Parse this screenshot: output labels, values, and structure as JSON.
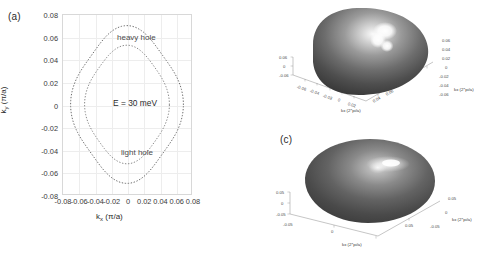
{
  "figure": {
    "panels": [
      {
        "tag": "(a)"
      },
      {
        "tag": "(b)"
      },
      {
        "tag": "(c)"
      }
    ]
  },
  "panel_a": {
    "tag": "(a)",
    "xlabel_main": "k",
    "xlabel_sub": "x",
    "xlabel_unit": "(π/a)",
    "ylabel_main": "k",
    "ylabel_sub": "y",
    "ylabel_unit": "(π/a)",
    "annotation_energy": "E = 30 meV",
    "label_heavy": "heavy hole",
    "label_light": "light hole",
    "xticks": [
      "-0.08",
      "-0.06",
      "-0.04",
      "-0.02",
      "0",
      "0.02",
      "0.04",
      "0.06",
      "0.08"
    ],
    "yticks": [
      "0.08",
      "0.06",
      "0.04",
      "0.02",
      "0",
      "-0.02",
      "-0.04",
      "-0.06",
      "-0.08"
    ]
  },
  "panel_b": {
    "tag": "(b)",
    "axis_x_title": "kx (2*pi/a)",
    "axis_y_title": "kx (2*pi/a)",
    "bottom_ticks": [
      "-0.06",
      "-0.04",
      "-0.02",
      "0",
      "0.02",
      "0.04",
      "0.06"
    ],
    "right_ticks": [
      "0.06",
      "0.04",
      "0.02",
      "0",
      "-0.02",
      "-0.04",
      "-0.06"
    ],
    "left_ticks": [
      "0.06",
      "0",
      "-0.06"
    ]
  },
  "panel_c": {
    "tag": "(c)",
    "axis_x_title": "kx (2*pi/a)",
    "axis_y_title": "kx (2*pi/a)",
    "bottom_ticks": [
      "0",
      "0.05"
    ],
    "right_ticks": [
      "0.05",
      "0",
      "-0.05"
    ],
    "left_ticks": [
      "0.05",
      "0",
      "-0.05",
      "-0.05"
    ]
  },
  "chart_data": {
    "type": "line",
    "xlabel": "k_x (π/a)",
    "ylabel": "k_y (π/a)",
    "xlim": [
      -0.08,
      0.08
    ],
    "ylim": [
      -0.08,
      0.08
    ],
    "xticks": [
      -0.08,
      -0.06,
      -0.04,
      -0.02,
      0,
      0.02,
      0.04,
      0.06,
      0.08
    ],
    "yticks": [
      -0.08,
      -0.06,
      -0.04,
      -0.02,
      0,
      0.02,
      0.04,
      0.06,
      0.08
    ],
    "grid": true,
    "legend": "none",
    "annotations": [
      {
        "text": "E = 30 meV",
        "x": 0.0,
        "y": 0.0
      },
      {
        "text": "heavy hole",
        "x": 0.012,
        "y": 0.057
      },
      {
        "text": "light hole",
        "x": 0.016,
        "y": -0.044
      }
    ],
    "series": [
      {
        "name": "heavy hole",
        "linestyle": "dotted",
        "color": "#6e6e6e",
        "description": "warped quasi-square contour, radius 0.062-0.070 (pi/a)",
        "r_mean": 0.0665,
        "warp_amplitude": 0.004,
        "warp_order": 4,
        "r_at_angle_deg": {
          "0": 0.0685,
          "45": 0.0628,
          "90": 0.0685,
          "135": 0.0628,
          "180": 0.0685,
          "225": 0.0628,
          "270": 0.0685,
          "315": 0.0628
        }
      },
      {
        "name": "light hole",
        "linestyle": "dotted",
        "color": "#8a8a8a",
        "description": "nearly circular inner contour, radius 0.048-0.053 (pi/a)",
        "r_mean": 0.0505,
        "warp_amplitude": 0.0025,
        "warp_order": 4,
        "r_at_angle_deg": {
          "0": 0.052,
          "45": 0.0483,
          "90": 0.052,
          "135": 0.0483,
          "180": 0.052,
          "225": 0.0483,
          "270": 0.052,
          "315": 0.0483
        }
      }
    ],
    "panel_b": {
      "type": "surface",
      "description": "3D constant-energy surface of the heavy-hole band: warped, box-like (cuboidal) shape with flattened faces and a bright specular highlight on the top face",
      "axis_x_label": "kx (2*pi/a)",
      "axis_y_label": "kx (2*pi/a)",
      "axis_x_range": [
        -0.06,
        0.06
      ],
      "axis_y_range": [
        -0.06,
        0.06
      ],
      "axis_z_range": [
        -0.06,
        0.06
      ]
    },
    "panel_c": {
      "type": "surface",
      "description": "3D constant-energy surface of the light-hole band: smooth, nearly spherical/ellipsoidal shape with a single central highlight",
      "axis_x_label": "kx (2*pi/a)",
      "axis_y_label": "kx (2*pi/a)",
      "axis_x_range": [
        -0.05,
        0.05
      ],
      "axis_y_range": [
        -0.05,
        0.05
      ],
      "axis_z_range": [
        -0.05,
        0.05
      ]
    }
  }
}
